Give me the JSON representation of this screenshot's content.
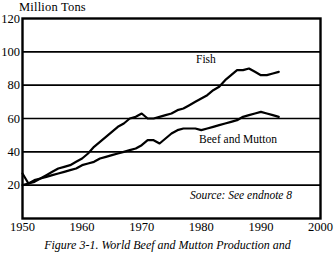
{
  "chart_data": {
    "type": "line",
    "title": "",
    "ylabel": "Million Tons",
    "xlabel": "",
    "xlim": [
      1950,
      2000
    ],
    "ylim": [
      0,
      120
    ],
    "grid": true,
    "legend_position": "inline-labels",
    "yticks": [
      120,
      100,
      80,
      60,
      40,
      20
    ],
    "xticks": [
      1950,
      1960,
      1970,
      1980,
      1990,
      2000
    ],
    "annotations": [
      "Source: See endnote 8"
    ],
    "series": [
      {
        "name": "Fish",
        "x": [
          1950,
          1951,
          1952,
          1953,
          1954,
          1955,
          1956,
          1957,
          1958,
          1959,
          1960,
          1961,
          1962,
          1963,
          1964,
          1965,
          1966,
          1967,
          1968,
          1969,
          1970,
          1971,
          1972,
          1973,
          1974,
          1975,
          1976,
          1977,
          1978,
          1979,
          1980,
          1981,
          1982,
          1983,
          1984,
          1985,
          1986,
          1987,
          1988,
          1989,
          1990,
          1991,
          1992,
          1993
        ],
        "values": [
          27,
          21,
          23,
          24,
          26,
          28,
          30,
          31,
          32,
          34,
          36,
          39,
          43,
          46,
          49,
          52,
          55,
          57,
          60,
          61,
          63,
          60,
          60,
          61,
          62,
          63,
          65,
          66,
          68,
          70,
          72,
          74,
          77,
          79,
          83,
          86,
          89,
          89,
          90,
          88,
          86,
          86,
          87,
          88
        ],
        "line_color": "#000000",
        "line_width": 2.2
      },
      {
        "name": "Beef and Mutton",
        "x": [
          1950,
          1951,
          1952,
          1953,
          1954,
          1955,
          1956,
          1957,
          1958,
          1959,
          1960,
          1961,
          1962,
          1963,
          1964,
          1965,
          1966,
          1967,
          1968,
          1969,
          1970,
          1971,
          1972,
          1973,
          1974,
          1975,
          1976,
          1977,
          1978,
          1979,
          1980,
          1981,
          1982,
          1983,
          1984,
          1985,
          1986,
          1987,
          1988,
          1989,
          1990,
          1991,
          1992,
          1993
        ],
        "values": [
          20,
          21,
          22,
          24,
          25,
          26,
          27,
          28,
          29,
          30,
          32,
          33,
          34,
          36,
          37,
          38,
          39,
          40,
          41,
          42,
          44,
          47,
          47,
          45,
          48,
          51,
          53,
          54,
          54,
          54,
          53,
          54,
          55,
          56,
          57,
          58,
          59,
          61,
          62,
          63,
          64,
          63,
          62,
          61
        ],
        "line_color": "#000000",
        "line_width": 2.2
      }
    ]
  },
  "labels": {
    "y_axis_title": "Million Tons",
    "fish": "Fish",
    "beef": "Beef and Mutton",
    "source": "Source: See endnote 8",
    "caption": "Figure 3-1. World Beef and Mutton Production and"
  },
  "colors": {
    "line": "#000000",
    "frame": "#000000",
    "grid": "#000000",
    "background": "#ffffff"
  }
}
